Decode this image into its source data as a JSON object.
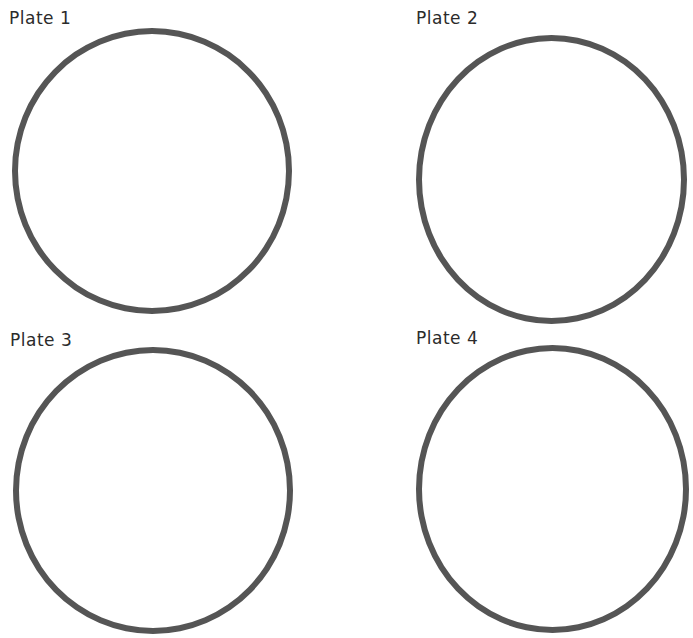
{
  "plates": [
    {
      "label": "Plate 1"
    },
    {
      "label": "Plate 2"
    },
    {
      "label": "Plate 3"
    },
    {
      "label": "Plate 4"
    }
  ],
  "colors": {
    "ring": "#555555",
    "label_text": "#2b2b2b",
    "background": "#ffffff"
  }
}
